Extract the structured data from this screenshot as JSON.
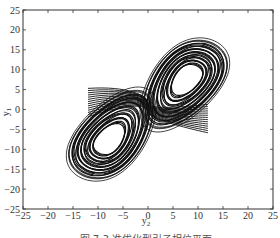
{
  "chart_data": {
    "type": "line",
    "title": "",
    "xlabel": "y2",
    "ylabel": "y1",
    "xlim": [
      -25,
      25
    ],
    "ylim": [
      -25,
      25
    ],
    "xticks": [
      -25,
      -20,
      -15,
      -10,
      -5,
      0,
      5,
      10,
      15,
      20,
      25
    ],
    "yticks": [
      -25,
      -20,
      -15,
      -10,
      -5,
      0,
      5,
      10,
      15,
      20,
      25
    ],
    "grid": false,
    "legend": null,
    "lobes": [
      {
        "name": "upper-right",
        "center": [
          8,
          8
        ],
        "x_range": [
          -2,
          18
        ],
        "y_range": [
          -6,
          24
        ]
      },
      {
        "name": "lower-left",
        "center": [
          -8,
          -8
        ],
        "x_range": [
          -17,
          2
        ],
        "y_range": [
          -24,
          6
        ]
      }
    ],
    "series": [
      {
        "name": "trajectory",
        "color": "#111111"
      }
    ]
  },
  "axes": {
    "x_tick_labels": [
      "−25",
      "−20",
      "−15",
      "−10",
      "−5",
      "0",
      "5",
      "10",
      "15",
      "20",
      "25"
    ],
    "y_tick_labels": [
      "25",
      "20",
      "15",
      "10",
      "5",
      "0",
      "−5",
      "−10",
      "−15",
      "−20",
      "−25"
    ],
    "xlabel_main": "y",
    "xlabel_sub": "2",
    "ylabel_main": "y",
    "ylabel_sub": "1"
  },
  "caption": "图 7-3  准优化型引子相位平面"
}
